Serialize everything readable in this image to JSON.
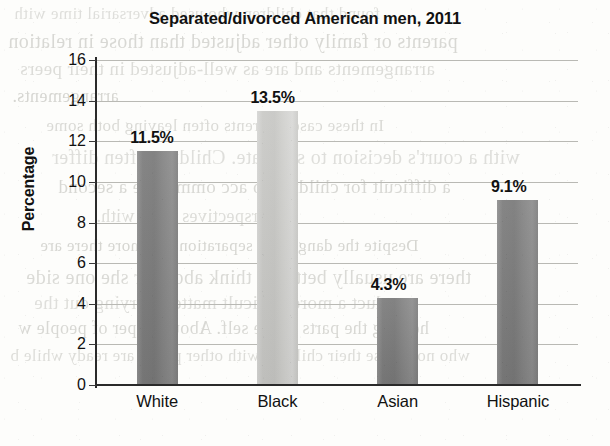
{
  "chart_data": {
    "type": "bar",
    "title": "Separated/divorced American men, 2011",
    "xlabel": "",
    "ylabel": "Percentage",
    "categories": [
      "White",
      "Black",
      "Asian",
      "Hispanic"
    ],
    "values": [
      11.5,
      13.5,
      4.3,
      9.1
    ],
    "data_labels": [
      "11.5%",
      "13.5%",
      "4.3%",
      "9.1%"
    ],
    "ylim": [
      0,
      16
    ],
    "ytick_step": 2,
    "ytick_labels": [
      "16",
      "14",
      "12",
      "10",
      "8",
      "6",
      "4",
      "2",
      "0"
    ],
    "ytick_values": [
      16,
      14,
      12,
      10,
      8,
      6,
      4,
      2,
      0
    ],
    "grid": "horizontal",
    "legend": "none",
    "bar_colors": [
      "#7d7d7d",
      "#cacac7",
      "#7d7d7d",
      "#7d7d7d"
    ],
    "axis_color": "#2a2a2a",
    "gridline_color": "#b9b9b4",
    "background": "#fdfdfb"
  },
  "page_artifacts": {
    "note": "faint mirrored bleed-through text from reverse of scanned book page",
    "lines": [
      "found that children who used adversarial time with",
      "parents or family other adjusted than those in  relation",
      "arrangements and are as well-adjusted  in  their peers",
      "arrangements.",
      "In these cases, parents often leaving both  some",
      "with a court's decision to separate. Children often differ",
      "a difficult for children to  acc  ommodate  a second",
      "perspectives to be  with.",
      "Despite the dangers of separation and  more  there are",
      "there are usually better to think about or she  one  side",
      "conduct a more  difficult  matter  carrying  out  the",
      "helping the  parts  of  the self. About 74 per of people w",
      "who now raise their  children  with  other peers, are ready  while b"
    ]
  }
}
